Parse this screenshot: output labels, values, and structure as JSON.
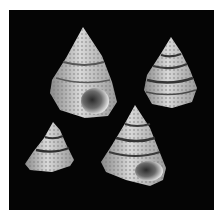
{
  "image": {
    "description": "Photograph of four conical top-snail shells with beaded spiral ridges and dark banding, on a black background with white border",
    "background_color": "#050505",
    "border_color": "#ffffff",
    "shell_color": "#c8c8c8",
    "band_color": "#3a3a3a"
  },
  "shells": [
    {
      "id": "shell-top-left",
      "apex": [
        83,
        27
      ],
      "base_left": [
        50,
        92
      ],
      "base_right": [
        116,
        100
      ],
      "bottom": 118,
      "aperture": [
        94,
        100
      ],
      "aperture_visible": true
    },
    {
      "id": "shell-top-right",
      "apex": [
        171,
        37
      ],
      "base_left": [
        144,
        78
      ],
      "base_right": [
        196,
        90
      ],
      "bottom": 107,
      "aperture_visible": false
    },
    {
      "id": "shell-bottom-left",
      "apex": [
        53,
        122
      ],
      "base_left": [
        25,
        163
      ],
      "base_right": [
        74,
        160
      ],
      "bottom": 172,
      "aperture_visible": false
    },
    {
      "id": "shell-bottom-right",
      "apex": [
        135,
        105
      ],
      "base_left": [
        101,
        160
      ],
      "base_right": [
        165,
        165
      ],
      "bottom": 186,
      "aperture": [
        148,
        170
      ],
      "aperture_visible": true
    }
  ]
}
